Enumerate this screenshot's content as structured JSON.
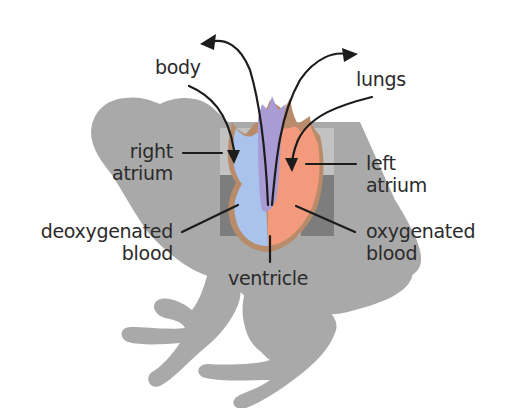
{
  "diagram": {
    "labels": {
      "body": "body",
      "lungs": "lungs",
      "right_atrium": [
        "right",
        "atrium"
      ],
      "left_atrium": [
        "left",
        "atrium"
      ],
      "deoxygenated_blood": [
        "deoxygenated",
        "blood"
      ],
      "oxygenated_blood": [
        "oxygenated",
        "blood"
      ],
      "ventricle": "ventricle"
    },
    "colors": {
      "frog_silhouette": "#a9a9a9",
      "inner_square": "#c4c4c4",
      "inner_square_shadow": "#7a7a7a",
      "deoxygenated": "#a9c3ec",
      "oxygenated": "#f39a7c",
      "vessel_purple": "#a99bd4",
      "heart_outline": "#b88b6a",
      "arrow": "#1c1c1c",
      "text": "#2b2b2b"
    }
  }
}
